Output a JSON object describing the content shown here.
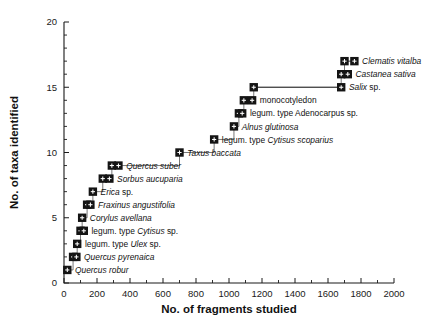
{
  "figure": {
    "background": "#ffffff",
    "marker_color": "#141414",
    "line_color": "#5f5f5f",
    "text_color": "#111111"
  },
  "chart_data": {
    "type": "line",
    "title": "",
    "subtitle": "",
    "xlabel": "No. of fragments studied",
    "ylabel": "No. of taxa identified",
    "xlim": [
      0,
      2000
    ],
    "ylim": [
      0,
      20
    ],
    "xticks": [
      0,
      200,
      400,
      600,
      800,
      1000,
      1200,
      1400,
      1600,
      1800,
      2000
    ],
    "xtick_labels": [
      "0",
      "200",
      "400",
      "600",
      "800",
      "1000",
      "1200",
      "1400",
      "1600",
      "1800",
      "2000"
    ],
    "yticks": [
      0,
      5,
      10,
      15,
      20
    ],
    "ytick_labels": [
      "0",
      "5",
      "10",
      "15",
      "20"
    ],
    "y_minor_tick_step": 1,
    "x_minor_tick_step": 100,
    "grid": false,
    "legend": null,
    "series": [
      {
        "name": "Cumulative taxa accumulation",
        "x": [
          20,
          55,
          80,
          100,
          110,
          140,
          175,
          235,
          700,
          910,
          1030,
          1060,
          1150,
          1680,
          1700,
          1740
        ],
        "values": [
          1,
          2,
          3,
          4,
          5,
          6,
          7,
          8,
          9,
          10,
          11,
          12,
          13,
          14,
          15,
          16
        ],
        "point_labels": [
          "Quercus robur",
          "Quercus pyrenaica",
          "legum. type Ulex sp.",
          "legum. type Cytisus sp.",
          "Corylus avellana",
          "Fraxinus angustifolia",
          "Erica sp.",
          "Sorbus aucuparia",
          "Quercus suber",
          "Taxus baccata",
          "legum. type Cytisus scoparius",
          "Alnus glutinosa",
          "legum. type Adenocarpus sp.",
          "monocotyledon",
          "Salix sp.",
          "Castanea sativa",
          "Clematis vitalba"
        ]
      }
    ],
    "annotations": [
      {
        "label_plain": "",
        "label_italic": "Quercus robur",
        "label_tail": "",
        "x": 20,
        "y": 1,
        "leader_x": 20
      },
      {
        "label_plain": "",
        "label_italic": "Quercus pyrenaica",
        "label_tail": "",
        "x": 55,
        "y": 2,
        "leader_x": 75
      },
      {
        "label_plain": "legum. type ",
        "label_italic": "Ulex",
        "label_tail": " sp.",
        "x": 80,
        "y": 3,
        "leader_x": 80
      },
      {
        "label_plain": "legum. type ",
        "label_italic": "Cytisus",
        "label_tail": " sp.",
        "x": 100,
        "y": 4,
        "leader_x": 120
      },
      {
        "label_plain": "",
        "label_italic": "Corylus avellana",
        "label_tail": "",
        "x": 110,
        "y": 5,
        "leader_x": 110
      },
      {
        "label_plain": "",
        "label_italic": "Fraxinus angustifolia",
        "label_tail": "",
        "x": 140,
        "y": 6,
        "leader_x": 160
      },
      {
        "label_plain": "",
        "label_italic": "Erica",
        "label_tail": " sp.",
        "x": 175,
        "y": 7,
        "leader_x": 175
      },
      {
        "label_plain": "",
        "label_italic": "Sorbus aucuparia",
        "label_tail": "",
        "x": 235,
        "y": 8,
        "leader_x": 275
      },
      {
        "label_plain": "",
        "label_italic": "Quercus suber",
        "label_tail": "",
        "x": 290,
        "y": 9,
        "leader_x": 330
      },
      {
        "label_plain": "",
        "label_italic": "Taxus baccata",
        "label_tail": "",
        "x": 700,
        "y": 10,
        "leader_x": 700
      },
      {
        "label_plain": "legum. type ",
        "label_italic": "Cytisus scoparius",
        "label_tail": "",
        "x": 910,
        "y": 11,
        "leader_x": 910
      },
      {
        "label_plain": "",
        "label_italic": "Alnus glutinosa",
        "label_tail": "",
        "x": 1030,
        "y": 12,
        "leader_x": 1030
      },
      {
        "label_plain": "legum. type Adenocarpus sp.",
        "label_italic": "",
        "label_tail": "",
        "x": 1060,
        "y": 13,
        "leader_x": 1080
      },
      {
        "label_plain": "monocotyledon",
        "label_italic": "",
        "label_tail": "",
        "x": 1090,
        "y": 14,
        "leader_x": 1140
      },
      {
        "label_plain": "",
        "label_italic": "Salix",
        "label_tail": " sp.",
        "x": 1150,
        "y": 15,
        "leader_x": 1680
      },
      {
        "label_plain": "",
        "label_italic": "Castanea sativa",
        "label_tail": "",
        "x": 1680,
        "y": 16,
        "leader_x": 1720
      },
      {
        "label_plain": "",
        "label_italic": "Clematis vitalba",
        "label_tail": "",
        "x": 1700,
        "y": 17,
        "leader_x": 1760
      }
    ]
  }
}
